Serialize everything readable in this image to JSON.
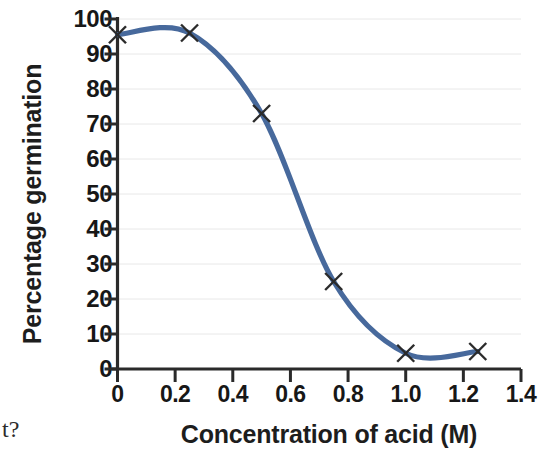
{
  "figure": {
    "y_axis_title": "Percentage germination",
    "x_axis_title": "Concentration of acid (M)",
    "page_fragment": "t?",
    "curve_color": "#47699c",
    "marker_color": "#2b2b2b",
    "grid_color": "#e8e8e8",
    "axis_color": "#2a2a2a"
  },
  "chart_data": {
    "type": "line",
    "title": "",
    "subtitle": "",
    "xlabel": "Concentration of acid (M)",
    "ylabel": "Percentage germination",
    "xlim": [
      0,
      1.4
    ],
    "ylim": [
      0,
      100
    ],
    "xticks": [
      0,
      0.2,
      0.4,
      0.6,
      0.8,
      1.0,
      1.2,
      1.4
    ],
    "xticklabels": [
      "0",
      "0.2",
      "0.4",
      "0.6",
      "0.8",
      "1.0",
      "1.2",
      "1.4"
    ],
    "yticks": [
      0,
      10,
      20,
      30,
      40,
      50,
      60,
      70,
      80,
      90,
      100
    ],
    "yticklabels": [
      "0",
      "10",
      "20",
      "30",
      "40",
      "50",
      "60",
      "70",
      "80",
      "90",
      "100"
    ],
    "grid": "horizontal",
    "legend": "none",
    "annotations": [],
    "series": [
      {
        "name": "Percentage germination",
        "marker": "x",
        "line_style": "smooth",
        "x": [
          0,
          0.25,
          0.5,
          0.75,
          1.0,
          1.25
        ],
        "values": [
          95.5,
          96,
          73,
          25,
          4.5,
          5
        ],
        "points": [
          {
            "x": 0,
            "y": 95.5
          },
          {
            "x": 0.25,
            "y": 96
          },
          {
            "x": 0.5,
            "y": 73
          },
          {
            "x": 0.75,
            "y": 25
          },
          {
            "x": 1.0,
            "y": 4.5
          },
          {
            "x": 1.25,
            "y": 5
          }
        ]
      }
    ]
  }
}
